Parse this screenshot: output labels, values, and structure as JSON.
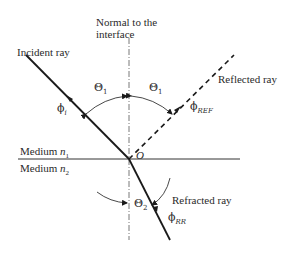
{
  "diagram": {
    "normal_label_line1": "Normal to the",
    "normal_label_line2": "interface",
    "incident_label": "Incident ray",
    "reflected_label": "Reflected ray",
    "refracted_label": "Refracted ray",
    "medium1_label": "Medium",
    "medium1_symbol": "n",
    "medium1_sub": "1",
    "medium2_label": "Medium",
    "medium2_symbol": "n",
    "medium2_sub": "2",
    "origin_label": "O",
    "theta_symbol": "Θ",
    "theta1_sub": "1",
    "theta2_sub": "2",
    "phi_symbol": "ϕ",
    "phi_incident_sub": "i",
    "phi_reflected_sub": "REF",
    "phi_refracted_sub": "RR",
    "colors": {
      "line": "#1a1a1a",
      "text": "#2a2a2a",
      "background": "#ffffff"
    }
  }
}
